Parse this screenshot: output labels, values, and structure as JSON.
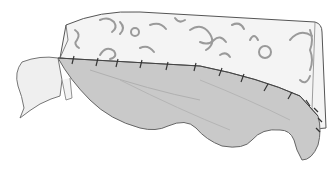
{
  "illustration": {
    "description": "Line drawing of a patterned fabric-covered box cushion with a plain grey fabric skirt pinned along its bottom edge, draping over the front",
    "colors": {
      "background": "#ffffff",
      "outline": "#555555",
      "patterned_fabric": "#f4f4f4",
      "pattern_marks": "#9a9a9a",
      "plain_fabric": "#c9c9c9",
      "plain_fabric_shadow": "#b5b5b5",
      "lining": "#efefef",
      "pins": "#333333"
    },
    "pin_count": 14
  }
}
